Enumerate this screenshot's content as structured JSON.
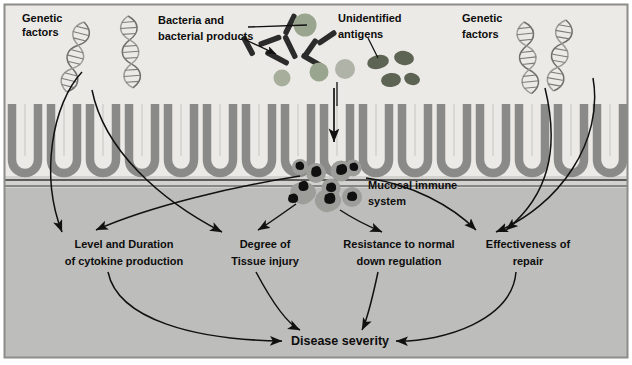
{
  "figure": {
    "background_top": "#eceae6",
    "background_bottom": "#bdbdbb",
    "epithelium_color": "#8a8a88",
    "epithelium_fill": "#d3d2cf",
    "border_color": "#8c8c8a",
    "ink": "#111111"
  },
  "labels": {
    "genetic_factors_left": {
      "line1": "Genetic",
      "line2": "factors"
    },
    "genetic_factors_right": {
      "line1": "Genetic",
      "line2": "factors"
    },
    "bacteria": {
      "line1": "Bacteria and",
      "line2": "bacterial products"
    },
    "antigens": {
      "line1": "Unidentified",
      "line2": "antigens"
    },
    "mucosal": {
      "line1": "Mucosal immune",
      "line2": "system"
    },
    "cytokine": {
      "line1": "Level and Duration",
      "line2": "of cytokine production"
    },
    "tissue_injury": {
      "line1": "Degree of",
      "line2": "Tissue injury"
    },
    "down_regulation": {
      "line1": "Resistance to normal",
      "line2": "down regulation"
    },
    "repair": {
      "line1": "Effectiveness of",
      "line2": "repair"
    },
    "outcome": {
      "line1": "Disease severity"
    }
  },
  "nodes": [
    {
      "id": "genetic-factors-left",
      "label": "Genetic factors",
      "x": 22,
      "y": 12
    },
    {
      "id": "bacteria-and-bacterial-products",
      "label": "Bacteria and bacterial products",
      "x": 158,
      "y": 14
    },
    {
      "id": "unidentified-antigens",
      "label": "Unidentified antigens",
      "x": 338,
      "y": 12
    },
    {
      "id": "genetic-factors-right",
      "label": "Genetic factors",
      "x": 462,
      "y": 12
    },
    {
      "id": "mucosal-immune-system",
      "label": "Mucosal immune system",
      "x": 368,
      "y": 182
    },
    {
      "id": "level-and-duration-of-cytokine-production",
      "label": "Level and Duration of cytokine production",
      "x": 72,
      "y": 238
    },
    {
      "id": "degree-of-tissue-injury",
      "label": "Degree of Tissue injury",
      "x": 228,
      "y": 238
    },
    {
      "id": "resistance-to-normal-down-regulation",
      "label": "Resistance to normal down regulation",
      "x": 335,
      "y": 238
    },
    {
      "id": "effectiveness-of-repair",
      "label": "Effectiveness of repair",
      "x": 478,
      "y": 238
    },
    {
      "id": "disease-severity",
      "label": "Disease severity",
      "x": 293,
      "y": 338
    }
  ],
  "edges": [
    {
      "from": "genetic-factors-left",
      "to": "level-and-duration-of-cytokine-production"
    },
    {
      "from": "genetic-factors-left",
      "to": "degree-of-tissue-injury"
    },
    {
      "from": "unidentified-antigens",
      "to": "mucosal-immune-system"
    },
    {
      "from": "genetic-factors-right",
      "to": "resistance-to-normal-down-regulation"
    },
    {
      "from": "genetic-factors-right",
      "to": "effectiveness-of-repair"
    },
    {
      "from": "mucosal-immune-system",
      "to": "level-and-duration-of-cytokine-production"
    },
    {
      "from": "mucosal-immune-system",
      "to": "degree-of-tissue-injury"
    },
    {
      "from": "mucosal-immune-system",
      "to": "resistance-to-normal-down-regulation"
    },
    {
      "from": "mucosal-immune-system",
      "to": "effectiveness-of-repair"
    },
    {
      "from": "level-and-duration-of-cytokine-production",
      "to": "disease-severity"
    },
    {
      "from": "degree-of-tissue-injury",
      "to": "disease-severity"
    },
    {
      "from": "resistance-to-normal-down-regulation",
      "to": "disease-severity"
    },
    {
      "from": "effectiveness-of-repair",
      "to": "disease-severity"
    }
  ],
  "graphics": {
    "dna_helices": 4,
    "bacteria_rods": 8,
    "antigen_circles": 4,
    "antigen_ellipses": 4,
    "immune_cells": 9,
    "epithelial_crypts": 16
  }
}
